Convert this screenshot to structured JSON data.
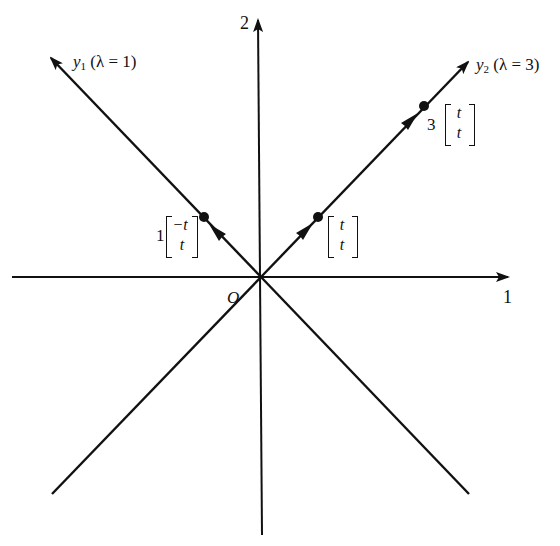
{
  "diagram": {
    "axes": {
      "horizontal_label": "1",
      "vertical_label": "2",
      "origin_label": "O"
    },
    "lines": [
      {
        "name": "y1",
        "label_var": "y",
        "label_sub": "1",
        "label_rest": "(λ = 1)",
        "direction": "outward"
      },
      {
        "name": "y2",
        "label_var": "y",
        "label_sub": "2",
        "label_rest": "(λ = 3)",
        "direction": "outward"
      }
    ],
    "points": [
      {
        "coef": "1",
        "top": "−t",
        "bottom": "t"
      },
      {
        "coef": "",
        "top": "t",
        "bottom": "t"
      },
      {
        "coef": "3",
        "top": "t",
        "bottom": "t"
      }
    ],
    "colors": {
      "ink": "#111111",
      "background": "#ffffff"
    }
  }
}
